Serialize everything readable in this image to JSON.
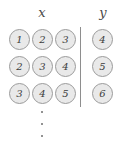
{
  "diagram": {
    "type": "dataset-table",
    "background_color": "#ffffff",
    "token_fill_color": "#e9e9e9",
    "token_border_color": "#9b9b9b",
    "text_color": "#3c3c3c",
    "divider_color": "#8e8e8e",
    "headers": {
      "x_label": "x",
      "y_label": "y"
    },
    "rows": [
      {
        "x": [
          "1",
          "2",
          "3"
        ],
        "y": [
          "4"
        ]
      },
      {
        "x": [
          "2",
          "3",
          "4"
        ],
        "y": [
          "5"
        ]
      },
      {
        "x": [
          "3",
          "4",
          "5"
        ],
        "y": [
          "6"
        ]
      }
    ],
    "continuation": {
      "symbol": "vertical-ellipsis",
      "dots": [
        "dot",
        "dot",
        "dot"
      ]
    }
  }
}
